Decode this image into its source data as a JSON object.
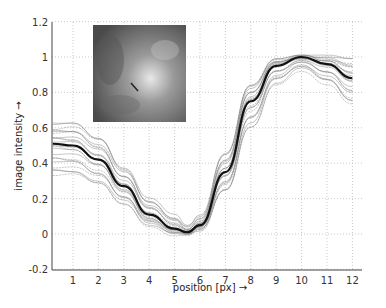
{
  "chart_data": {
    "type": "line",
    "title": "",
    "xlabel": "position [px] →",
    "ylabel": "image intensity →",
    "xlim": [
      0.17,
      12.4
    ],
    "ylim": [
      -0.2,
      1.2
    ],
    "x_ticks": [
      "1",
      "2",
      "3",
      "4",
      "5",
      "6",
      "7",
      "8",
      "9",
      "10",
      "11",
      "12"
    ],
    "y_ticks": [
      "-0.2",
      "0",
      "0.2",
      "0.4",
      "0.6",
      "0.8",
      "1",
      "1.2"
    ],
    "grid": true,
    "legend": null,
    "inset": "grayscale image patch with short dark line segment marking profile location",
    "x": [
      0.2,
      1,
      2,
      3,
      4,
      5,
      5.5,
      6,
      7,
      8,
      9,
      10,
      11,
      12
    ],
    "series": [
      {
        "name": "mean profile (bold)",
        "values": [
          0.51,
          0.5,
          0.42,
          0.27,
          0.11,
          0.03,
          0.01,
          0.05,
          0.35,
          0.75,
          0.95,
          1.0,
          0.96,
          0.88
        ]
      },
      {
        "name": "upper envelope",
        "values": [
          0.62,
          0.63,
          0.55,
          0.38,
          0.2,
          0.1,
          0.04,
          0.1,
          0.46,
          0.85,
          0.99,
          1.0,
          1.0,
          0.99
        ]
      },
      {
        "name": "lower envelope",
        "values": [
          0.33,
          0.33,
          0.28,
          0.17,
          0.05,
          0.0,
          0.0,
          0.02,
          0.24,
          0.6,
          0.85,
          0.93,
          0.85,
          0.73
        ]
      }
    ]
  },
  "axes": {
    "xlabel": "position [px] →",
    "ylabel": "image intensity →"
  }
}
